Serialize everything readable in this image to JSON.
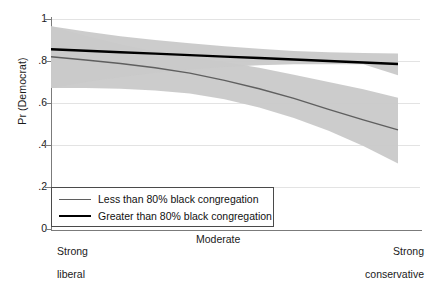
{
  "chart_data": {
    "type": "line",
    "title": "",
    "subtitle": "",
    "xlabel": "",
    "ylabel": "Pr (Democrat)",
    "xlim": [
      0,
      1
    ],
    "ylim": [
      0,
      1
    ],
    "grid": true,
    "legend_position": "bottom-left",
    "x_tick_labels": [
      "Strong\nliberal",
      "Moderate",
      "Strong\nconservative"
    ],
    "x_tick_positions": [
      0,
      0.5,
      1
    ],
    "y_ticks": [
      0,
      0.2,
      0.4,
      0.6,
      0.8,
      1
    ],
    "y_tick_labels": [
      "0",
      ".2",
      ".4",
      ".6",
      ".8",
      "1"
    ],
    "series": [
      {
        "name": "Less than 80% black congregation",
        "color": "#5f5f5f",
        "line_width": 1.4,
        "x": [
          0,
          0.1,
          0.2,
          0.3,
          0.4,
          0.5,
          0.6,
          0.7,
          0.8,
          0.9,
          1
        ],
        "values": [
          0.82,
          0.805,
          0.788,
          0.768,
          0.742,
          0.708,
          0.668,
          0.622,
          0.57,
          0.52,
          0.472
        ],
        "band_upper": [
          0.965,
          0.92,
          0.88,
          0.845,
          0.818,
          0.795,
          0.768,
          0.735,
          0.7,
          0.665,
          0.625
        ],
        "band_lower": [
          0.672,
          0.672,
          0.668,
          0.66,
          0.645,
          0.618,
          0.578,
          0.528,
          0.468,
          0.395,
          0.312
        ],
        "band_color": "#c9c9c9"
      },
      {
        "name": "Greater than 80% black congregation",
        "color": "#000000",
        "line_width": 2.4,
        "x": [
          0,
          0.1,
          0.2,
          0.3,
          0.4,
          0.5,
          0.6,
          0.7,
          0.8,
          0.9,
          1
        ],
        "values": [
          0.856,
          0.849,
          0.842,
          0.835,
          0.828,
          0.821,
          0.814,
          0.807,
          0.8,
          0.793,
          0.786
        ],
        "band_upper": [
          0.965,
          0.94,
          0.918,
          0.9,
          0.884,
          0.87,
          0.858,
          0.848,
          0.842,
          0.838,
          0.836
        ],
        "band_lower": [
          0.672,
          0.7,
          0.724,
          0.744,
          0.76,
          0.772,
          0.78,
          0.784,
          0.785,
          0.784,
          0.732
        ],
        "band_color": "#c9c9c9"
      }
    ],
    "legend": [
      {
        "label": "Less than 80% black congregation",
        "style": "thin-gray"
      },
      {
        "label": "Greater than 80% black congregation",
        "style": "thick-black"
      }
    ],
    "colors": {
      "band": "#c9c9c9",
      "axis": "#7b7b7b",
      "grid": "#e3e3e3",
      "text": "#1a1a1a",
      "background": "#ffffff"
    }
  },
  "axis": {
    "y_label": "Pr (Democrat)",
    "y_ticks": [
      "1",
      ".8",
      ".6",
      ".4",
      ".2",
      "0"
    ],
    "x_tick_left_line1": "Strong",
    "x_tick_left_line2": "liberal",
    "x_tick_mid": "Moderate",
    "x_tick_right_line1": "Strong",
    "x_tick_right_line2": "conservative"
  },
  "legend": {
    "item_1": "Less than 80% black congregation",
    "item_2": "Greater than 80% black congregation"
  }
}
